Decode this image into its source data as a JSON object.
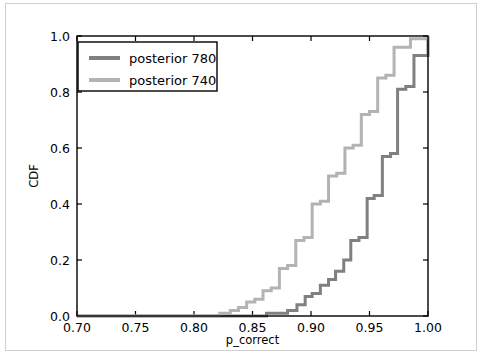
{
  "chart_data": {
    "type": "line",
    "subtype": "step-cdf",
    "title": "",
    "xlabel": "p_correct",
    "ylabel": "CDF",
    "xlim": [
      0.7,
      1.0
    ],
    "ylim": [
      0.0,
      1.0
    ],
    "grid": false,
    "legend_position": "upper left",
    "xticks": [
      0.7,
      0.75,
      0.8,
      0.85,
      0.9,
      0.95,
      1.0
    ],
    "xtick_labels": [
      "0.70",
      "0.75",
      "0.80",
      "0.85",
      "0.90",
      "0.95",
      "1.00"
    ],
    "yticks": [
      0.0,
      0.2,
      0.4,
      0.6,
      0.8,
      1.0
    ],
    "ytick_labels": [
      "0.0",
      "0.2",
      "0.4",
      "0.6",
      "0.8",
      "1.0"
    ],
    "series": [
      {
        "name": "posterior 780",
        "color": "#808080",
        "linewidth": 3,
        "x": [
          0.7,
          0.845,
          0.862,
          0.873,
          0.88,
          0.888,
          0.895,
          0.901,
          0.908,
          0.915,
          0.921,
          0.928,
          0.934,
          0.941,
          0.948,
          0.954,
          0.961,
          0.968,
          0.974,
          0.981,
          0.988,
          1.0
        ],
        "y": [
          0.0,
          0.0,
          0.01,
          0.01,
          0.02,
          0.04,
          0.07,
          0.08,
          0.11,
          0.13,
          0.16,
          0.2,
          0.27,
          0.28,
          0.42,
          0.43,
          0.57,
          0.58,
          0.81,
          0.82,
          0.93,
          1.0
        ]
      },
      {
        "name": "posterior 740",
        "color": "#b3b3b3",
        "linewidth": 3,
        "x": [
          0.7,
          0.812,
          0.822,
          0.831,
          0.838,
          0.845,
          0.852,
          0.859,
          0.866,
          0.873,
          0.88,
          0.887,
          0.894,
          0.901,
          0.908,
          0.915,
          0.922,
          0.929,
          0.936,
          0.943,
          0.95,
          0.957,
          0.964,
          0.971,
          0.985,
          1.0
        ],
        "y": [
          0.0,
          0.0,
          0.01,
          0.02,
          0.03,
          0.05,
          0.06,
          0.09,
          0.1,
          0.17,
          0.18,
          0.27,
          0.28,
          0.4,
          0.41,
          0.5,
          0.51,
          0.6,
          0.61,
          0.72,
          0.73,
          0.85,
          0.86,
          0.96,
          0.99,
          1.0
        ]
      }
    ]
  },
  "axes": {
    "xlabel": "p_correct",
    "ylabel": "CDF",
    "xtick_labels": [
      "0.70",
      "0.75",
      "0.80",
      "0.85",
      "0.90",
      "0.95",
      "1.00"
    ],
    "ytick_labels": [
      "0.0",
      "0.2",
      "0.4",
      "0.6",
      "0.8",
      "1.0"
    ]
  },
  "legend": {
    "entries": [
      {
        "label": "posterior 780",
        "color": "#808080"
      },
      {
        "label": "posterior 740",
        "color": "#b3b3b3"
      }
    ]
  },
  "colors": {
    "axis": "#000000",
    "frame": "#cfcfcf",
    "background": "#ffffff",
    "series_780": "#808080",
    "series_740": "#b3b3b3"
  }
}
